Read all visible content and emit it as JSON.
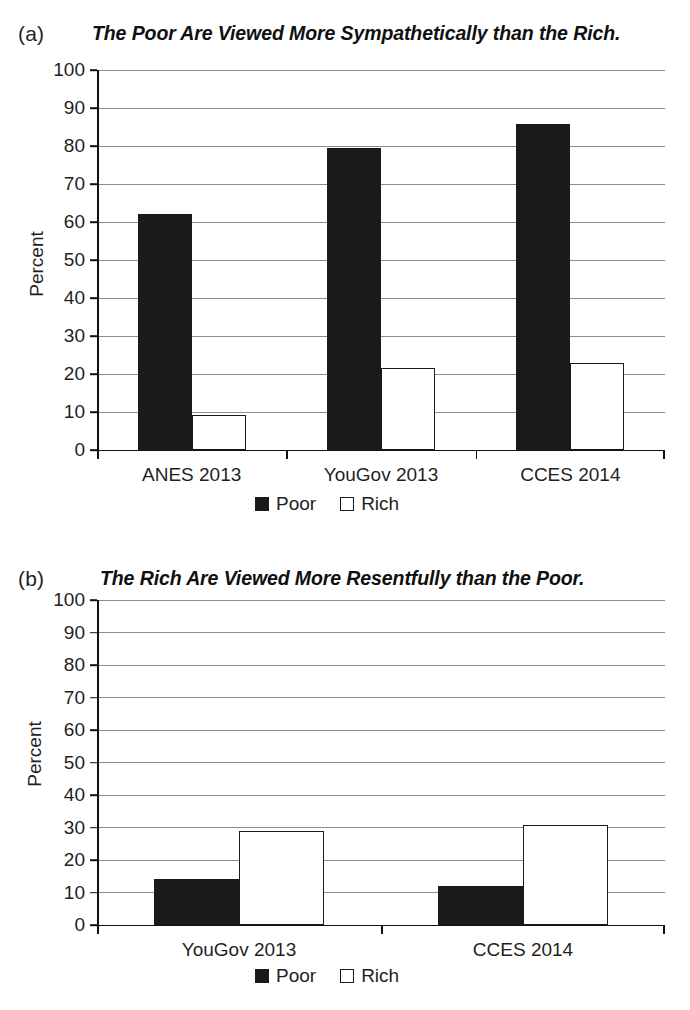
{
  "panels": [
    {
      "panel_label": "(a)",
      "title": "The Poor Are Viewed More Sympathetically than the Rich.",
      "ylabel": "Percent",
      "legend": [
        {
          "label": "Poor",
          "swatch": "filled-black-square-icon"
        },
        {
          "label": "Rich",
          "swatch": "open-white-square-icon"
        }
      ]
    },
    {
      "panel_label": "(b)",
      "title": "The Rich Are Viewed More Resentfully than the Poor.",
      "ylabel": "Percent",
      "legend": [
        {
          "label": "Poor",
          "swatch": "filled-black-square-icon"
        },
        {
          "label": "Rich",
          "swatch": "open-white-square-icon"
        }
      ]
    }
  ],
  "chart_data": [
    {
      "type": "bar",
      "title": "The Poor Are Viewed More Sympathetically than the Rich.",
      "panel": "(a)",
      "xlabel": "",
      "ylabel": "Percent",
      "ylim": [
        0,
        100
      ],
      "yticks": [
        0,
        10,
        20,
        30,
        40,
        50,
        60,
        70,
        80,
        90,
        100
      ],
      "grid": true,
      "legend_position": "bottom-center",
      "categories": [
        "ANES 2013",
        "YouGov 2013",
        "CCES 2014"
      ],
      "series": [
        {
          "name": "Poor",
          "color": "#1a1a1a",
          "values": [
            62.2,
            79.4,
            85.8
          ]
        },
        {
          "name": "Rich",
          "color": "#ffffff",
          "values": [
            9.1,
            21.5,
            22.8
          ]
        }
      ]
    },
    {
      "type": "bar",
      "title": "The Rich Are Viewed More Resentfully than the Poor.",
      "panel": "(b)",
      "xlabel": "",
      "ylabel": "Percent",
      "ylim": [
        0,
        100
      ],
      "yticks": [
        0,
        10,
        20,
        30,
        40,
        50,
        60,
        70,
        80,
        90,
        100
      ],
      "grid": true,
      "legend_position": "bottom-center",
      "categories": [
        "YouGov 2013",
        "CCES 2014"
      ],
      "series": [
        {
          "name": "Poor",
          "color": "#1a1a1a",
          "values": [
            14.2,
            11.9
          ]
        },
        {
          "name": "Rich",
          "color": "#ffffff",
          "values": [
            29.0,
            30.8
          ]
        }
      ]
    }
  ]
}
